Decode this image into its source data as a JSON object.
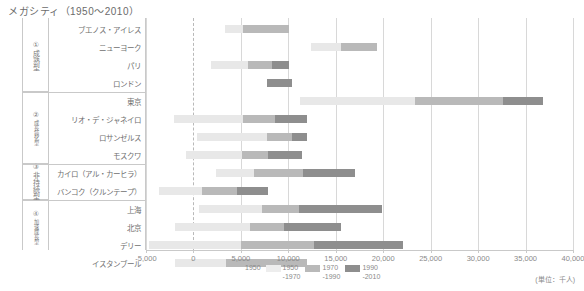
{
  "title": "メガシティ（1950～2010）",
  "unit_note": "(単位：千人)",
  "axis": {
    "ticks": [
      "-5,000",
      "0",
      "5,000",
      "10,000",
      "15,000",
      "20,000",
      "25,000",
      "30,000",
      "35,000",
      "40,000"
    ],
    "tick_values": [
      -5000,
      0,
      5000,
      10000,
      15000,
      20000,
      25000,
      30000,
      35000,
      40000
    ],
    "xmin": -5000,
    "xmax": 40000
  },
  "legend": [
    {
      "key": "1950",
      "label": "1950",
      "color": "#ffffff"
    },
    {
      "key": "1950-1970",
      "label": "1950\n-1970",
      "color": "#ededed"
    },
    {
      "key": "1970-1990",
      "label": "1970\n-1990",
      "color": "#b9b9b9"
    },
    {
      "key": "1990-2010",
      "label": "1990\n-2010",
      "color": "#8e8e8e"
    }
  ],
  "groups": [
    {
      "num": "①",
      "name": "成熟型",
      "rows": 4
    },
    {
      "num": "②",
      "name": "成長鈍化型",
      "rows": 4
    },
    {
      "num": "③",
      "name": "非持続型",
      "rows": 2
    },
    {
      "num": "④",
      "name": "加速成長型",
      "rows": 3
    }
  ],
  "chart_data": {
    "type": "bar",
    "title": "メガシティ（1950～2010）",
    "xlabel": "",
    "ylabel": "",
    "xlim": [
      -5000,
      40000
    ],
    "grid": true,
    "legend_position": "bottom",
    "series": [
      {
        "name": "1950-1970",
        "color": "#ededed"
      },
      {
        "name": "1970-1990",
        "color": "#b9b9b9"
      },
      {
        "name": "1990-2010",
        "color": "#8e8e8e"
      }
    ],
    "categories": [
      "ブエノス・アイレス",
      "ニューヨーク",
      "パリ",
      "ロンドン",
      "東京",
      "リオ・デ・ジャネイロ",
      "ロサンゼルス",
      "モスクワ",
      "カイロ（アル・カーヒラ）",
      "バンコク（クルンテープ）",
      "上海",
      "北京",
      "デリー",
      "イスタンブール"
    ],
    "bars": [
      {
        "city": "ブエノス・アイレス",
        "start": 3300,
        "seg_5070": 1900,
        "seg_7090": 4900,
        "seg_9010": 0,
        "end": 10100
      },
      {
        "city": "ニューヨーク",
        "start": 12400,
        "seg_5070": 3100,
        "seg_7090": 3800,
        "seg_9010": 0,
        "end": 19300
      },
      {
        "city": "パリ",
        "start": 1800,
        "seg_5070": 4000,
        "seg_7090": 2500,
        "seg_9010": 1800,
        "end": 10100
      },
      {
        "city": "ロンドン",
        "start": 7700,
        "seg_5070": 0,
        "seg_7090": 0,
        "seg_9010": 2700,
        "end": 10400
      },
      {
        "city": "東京",
        "start": 11200,
        "seg_5070": 12200,
        "seg_7090": 9200,
        "seg_9010": 4200,
        "end": 36800
      },
      {
        "city": "リオ・デ・ジャネイロ",
        "start": -2000,
        "seg_5070": 7200,
        "seg_7090": 3400,
        "seg_9010": 3400,
        "end": 12000
      },
      {
        "city": "ロサンゼルス",
        "start": 400,
        "seg_5070": 7400,
        "seg_7090": 2600,
        "seg_9010": 1600,
        "end": 12000
      },
      {
        "city": "モスクワ",
        "start": -800,
        "seg_5070": 5900,
        "seg_7090": 2800,
        "seg_9010": 3500,
        "end": 11400
      },
      {
        "city": "カイロ（アル・カーヒラ）",
        "start": 2400,
        "seg_5070": 4000,
        "seg_7090": 5100,
        "seg_9010": 5500,
        "end": 17000
      },
      {
        "city": "バンコク（クルンテープ）",
        "start": -3600,
        "seg_5070": 4500,
        "seg_7090": 3700,
        "seg_9010": 3300,
        "end": 7900
      },
      {
        "city": "上海",
        "start": 600,
        "seg_5070": 6600,
        "seg_7090": 3900,
        "seg_9010": 8800,
        "end": 19900
      },
      {
        "city": "北京",
        "start": -1900,
        "seg_5070": 7900,
        "seg_7090": 3500,
        "seg_9010": 6100,
        "end": 15600
      },
      {
        "city": "デリー",
        "start": -4700,
        "seg_5070": 9700,
        "seg_7090": 7700,
        "seg_9010": 9400,
        "end": 22100
      },
      {
        "city": "イスタンブール",
        "start": -1900,
        "seg_5070": 5300,
        "seg_7090": 8600,
        "seg_9010": 0,
        "end": 12000
      }
    ]
  }
}
